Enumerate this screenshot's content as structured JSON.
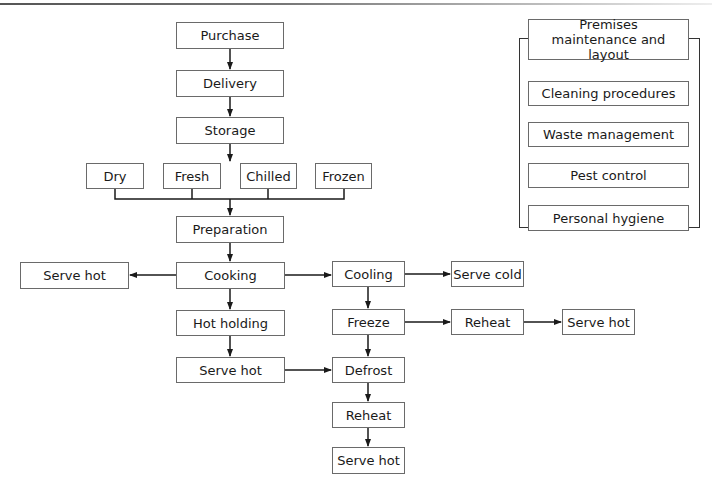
{
  "diagram": {
    "type": "flowchart",
    "title": "",
    "main_flow": {
      "purchase": "Purchase",
      "delivery": "Delivery",
      "storage": "Storage",
      "storage_types": [
        "Dry",
        "Fresh",
        "Chilled",
        "Frozen"
      ],
      "preparation": "Preparation",
      "cooking": "Cooking",
      "serve_hot_left": "Serve hot",
      "hot_holding": "Hot holding",
      "serve_hot_mid": "Serve hot",
      "cooling": "Cooling",
      "serve_cold": "Serve cold",
      "freeze": "Freeze",
      "reheat_right": "Reheat",
      "serve_hot_right": "Serve hot",
      "defrost": "Defrost",
      "reheat_bottom": "Reheat",
      "serve_hot_bottom": "Serve hot"
    },
    "prerequisites": {
      "items": [
        "Premises maintenance and layout",
        "Cleaning procedures",
        "Waste management",
        "Pest control",
        "Personal hygiene"
      ]
    },
    "edges": [
      [
        "Purchase",
        "Delivery"
      ],
      [
        "Delivery",
        "Storage"
      ],
      [
        "Storage",
        "Dry|Fresh|Chilled|Frozen"
      ],
      [
        "Dry|Fresh|Chilled|Frozen",
        "Preparation"
      ],
      [
        "Preparation",
        "Cooking"
      ],
      [
        "Cooking",
        "Serve hot (left)"
      ],
      [
        "Cooking",
        "Cooling"
      ],
      [
        "Cooking",
        "Hot holding"
      ],
      [
        "Hot holding",
        "Serve hot (mid)"
      ],
      [
        "Serve hot (mid)",
        "Defrost"
      ],
      [
        "Cooling",
        "Serve cold"
      ],
      [
        "Cooling",
        "Freeze"
      ],
      [
        "Freeze",
        "Reheat (right)"
      ],
      [
        "Reheat (right)",
        "Serve hot (right)"
      ],
      [
        "Freeze",
        "Defrost"
      ],
      [
        "Defrost",
        "Reheat (bottom)"
      ],
      [
        "Reheat (bottom)",
        "Serve hot (bottom)"
      ]
    ],
    "colors": {
      "line": "#1a1a1a",
      "box_border": "#6a6a6a",
      "background": "#ffffff"
    }
  }
}
